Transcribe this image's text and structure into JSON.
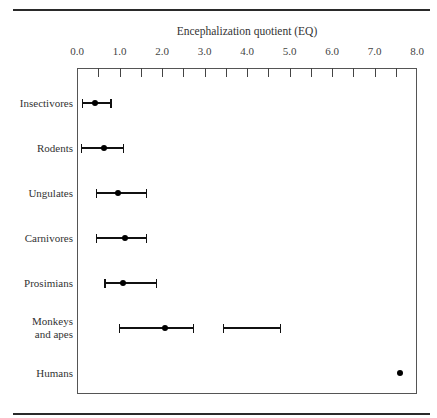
{
  "chart_data": {
    "type": "scatter",
    "subtype": "range-plot",
    "title": "",
    "xlabel": "Encephalization quotient (EQ)",
    "ylabel": "",
    "xlim": [
      0,
      8
    ],
    "x_ticks": [
      "0.0",
      "1.0",
      "2.0",
      "3.0",
      "4.0",
      "5.0",
      "6.0",
      "7.0",
      "8.0"
    ],
    "minor_ticks_every": 0.5,
    "grid": false,
    "legend": null,
    "categories": [
      "Insectivores",
      "Rodents",
      "Ungulates",
      "Carnivores",
      "Prosimians",
      "Monkeys and apes",
      "Humans"
    ],
    "series": [
      {
        "name": "Insectivores",
        "ranges": [
          [
            0.12,
            0.8
          ]
        ],
        "mean": 0.43
      },
      {
        "name": "Rodents",
        "ranges": [
          [
            0.1,
            1.1
          ]
        ],
        "mean": 0.63
      },
      {
        "name": "Ungulates",
        "ranges": [
          [
            0.45,
            1.64
          ]
        ],
        "mean": 0.97
      },
      {
        "name": "Carnivores",
        "ranges": [
          [
            0.45,
            1.64
          ]
        ],
        "mean": 1.13
      },
      {
        "name": "Prosimians",
        "ranges": [
          [
            0.66,
            1.87
          ]
        ],
        "mean": 1.09
      },
      {
        "name": "Monkeys and apes",
        "ranges": [
          [
            1.0,
            2.74
          ],
          [
            3.45,
            4.78
          ]
        ],
        "mean": 2.08
      },
      {
        "name": "Humans",
        "ranges": [],
        "mean": 7.59
      }
    ]
  },
  "labels": {
    "axis_title": "Encephalization quotient (EQ)",
    "row_labels": [
      "Insectivores",
      "Rodents",
      "Ungulates",
      "Carnivores",
      "Prosimians",
      "Monkeys\nand apes",
      "Humans"
    ]
  }
}
